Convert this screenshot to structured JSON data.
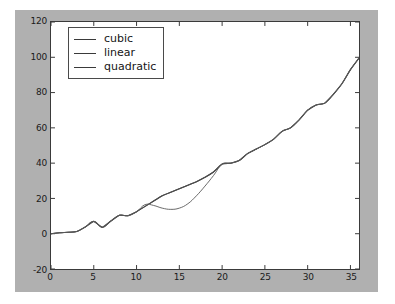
{
  "chart_data": {
    "type": "line",
    "title": "",
    "xlabel": "",
    "ylabel": "",
    "xlim": [
      0,
      36
    ],
    "ylim": [
      -20,
      120
    ],
    "grid": false,
    "legend_position": "upper left",
    "xticks": [
      "0",
      "5",
      "10",
      "15",
      "20",
      "25",
      "30",
      "35"
    ],
    "xtick_values": [
      0,
      5,
      10,
      15,
      20,
      25,
      30,
      35
    ],
    "yticks": [
      "-20",
      "0",
      "20",
      "40",
      "60",
      "80",
      "100",
      "120"
    ],
    "ytick_values": [
      -20,
      0,
      20,
      40,
      60,
      80,
      100,
      120
    ],
    "colors": {
      "cubic": "#3a3a3a",
      "linear": "#4d4d4d",
      "quadratic": "#5a5a5a",
      "figure_background": "#b0b0b0",
      "axes_background": "#ffffff",
      "axis_line": "#3a3a3a",
      "tick_label": "#1a1a1a"
    },
    "x": [
      0,
      1,
      2,
      3,
      4,
      5,
      6,
      7,
      8,
      9,
      10,
      11,
      12,
      13,
      14,
      15,
      16,
      17,
      18,
      19,
      20,
      21,
      22,
      23,
      24,
      25,
      26,
      27,
      28,
      29,
      30,
      31,
      32,
      33,
      34,
      35,
      36
    ],
    "series": [
      {
        "name": "cubic",
        "values": [
          0,
          0.5,
          0.8,
          1.2,
          3.8,
          7.0,
          3.6,
          7.2,
          10.5,
          10.2,
          12.5,
          15.5,
          18.5,
          21.5,
          23.5,
          25.5,
          27.5,
          29.5,
          32.0,
          35.0,
          39.5,
          40.0,
          41.5,
          45.5,
          48.0,
          50.5,
          53.5,
          58.0,
          60.0,
          64.5,
          70.0,
          73.0,
          74.0,
          79.0,
          85.0,
          93.0,
          99.5
        ]
      },
      {
        "name": "linear",
        "values": [
          0,
          0.5,
          0.8,
          1.2,
          3.8,
          7.0,
          3.6,
          7.2,
          10.5,
          10.2,
          12.5,
          15.5,
          18.5,
          21.5,
          23.5,
          25.5,
          27.5,
          29.5,
          32.0,
          35.0,
          39.5,
          40.0,
          41.5,
          45.5,
          48.0,
          50.5,
          53.5,
          58.0,
          60.0,
          64.5,
          70.0,
          73.0,
          74.0,
          79.0,
          85.0,
          93.0,
          99.5
        ]
      },
      {
        "name": "quadratic",
        "values": [
          0,
          0.5,
          0.8,
          1.2,
          3.8,
          7.0,
          3.6,
          7.2,
          10.5,
          10.2,
          12.5,
          16.5,
          16.0,
          14.5,
          13.8,
          14.5,
          17.0,
          21.5,
          27.0,
          33.0,
          39.5,
          40.0,
          41.5,
          45.5,
          48.0,
          50.5,
          53.5,
          58.0,
          60.0,
          64.5,
          70.0,
          73.0,
          74.0,
          79.0,
          85.0,
          93.0,
          99.5
        ]
      }
    ],
    "legend_entries": [
      {
        "label": "cubic"
      },
      {
        "label": "linear"
      },
      {
        "label": "quadratic"
      }
    ]
  }
}
